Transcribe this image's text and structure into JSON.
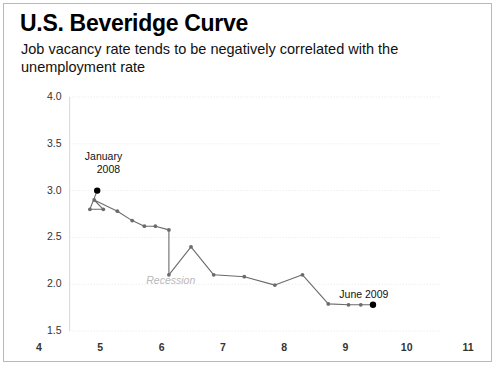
{
  "header": {
    "title": "U.S. Beveridge Curve",
    "subtitle": "Job vacancy rate tends to be negatively correlated with the unemployment rate"
  },
  "chart_data": {
    "type": "line",
    "title": "U.S. Beveridge Curve",
    "subtitle": "Job vacancy rate tends to be negatively correlated with the unemployment rate",
    "xlabel": "",
    "ylabel": "",
    "xlim": [
      4,
      11
    ],
    "ylim": [
      1.5,
      4.0
    ],
    "xticks": [
      "4",
      "5",
      "6",
      "7",
      "8",
      "9",
      "10",
      "11"
    ],
    "yticks": [
      "1.5",
      "2.0",
      "2.5",
      "3.0",
      "3.5",
      "4.0"
    ],
    "grid": true,
    "grid_style": "dotted-horizontal",
    "legend": "none",
    "line_color": "#6b6b6b",
    "marker_color": "#6b6b6b",
    "highlight_marker_color": "#000000",
    "series": [
      {
        "name": "Beveridge curve path",
        "x": [
          4.95,
          4.83,
          5.05,
          4.9,
          5.28,
          5.52,
          5.72,
          5.9,
          6.12,
          6.12,
          6.48,
          6.85,
          7.35,
          7.85,
          8.3,
          8.72,
          9.05,
          9.25,
          9.45
        ],
        "y": [
          3.0,
          2.8,
          2.8,
          2.9,
          2.78,
          2.68,
          2.62,
          2.62,
          2.58,
          2.1,
          2.4,
          2.1,
          2.08,
          1.99,
          2.1,
          1.79,
          1.78,
          1.78,
          1.78
        ]
      }
    ],
    "annotations": [
      {
        "text": "January",
        "x": 5.05,
        "y": 3.36,
        "style": "label"
      },
      {
        "text": "2008",
        "x": 5.13,
        "y": 3.22,
        "style": "label"
      },
      {
        "text": "Recession",
        "x": 6.15,
        "y": 2.03,
        "style": "recession"
      },
      {
        "text": "June 2009",
        "x": 9.3,
        "y": 1.88,
        "style": "label"
      }
    ],
    "highlight_points": [
      {
        "label": "January 2008",
        "x": 4.95,
        "y": 3.0
      },
      {
        "label": "June 2009",
        "x": 9.45,
        "y": 1.78
      }
    ]
  }
}
